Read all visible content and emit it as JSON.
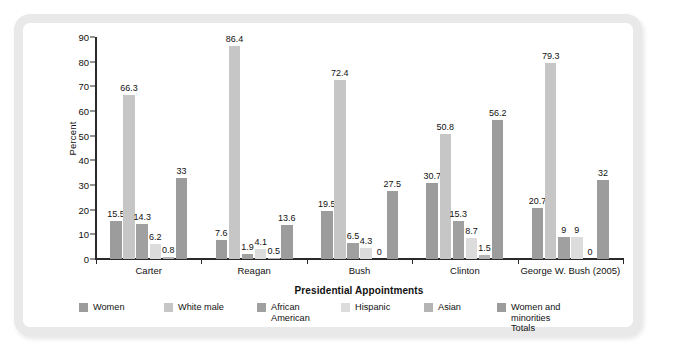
{
  "chart_data": {
    "type": "bar",
    "title": "",
    "xlabel": "Presidential Appointments",
    "ylabel": "Percent",
    "ylim": [
      0,
      90
    ],
    "ytick_step": 10,
    "yticks": [
      0,
      10,
      20,
      30,
      40,
      50,
      60,
      70,
      80,
      90
    ],
    "grid": false,
    "legend_position": "bottom",
    "categories": [
      "Carter",
      "Reagan",
      "Bush",
      "Clinton",
      "George W. Bush (2005)"
    ],
    "series": [
      {
        "name": "Women",
        "color": "#9c9c9c",
        "values": [
          15.5,
          7.6,
          19.5,
          30.7,
          20.7
        ],
        "labels": [
          "15.5",
          "7.6",
          "19.5",
          "30.7",
          "20.7"
        ]
      },
      {
        "name": "White male",
        "color": "#c6c6c6",
        "values": [
          66.3,
          86.4,
          72.4,
          50.8,
          79.3
        ],
        "labels": [
          "66.3",
          "86.4",
          "72.4",
          "50.8",
          "79.3"
        ]
      },
      {
        "name": "African\nAmerican",
        "color": "#a0a0a0",
        "values": [
          14.3,
          1.9,
          6.5,
          15.3,
          9
        ],
        "labels": [
          "14.3",
          "1.9",
          "6.5",
          "15.3",
          "9"
        ]
      },
      {
        "name": "Hispanic",
        "color": "#dcdcdc",
        "values": [
          6.2,
          4.1,
          4.3,
          8.7,
          9
        ],
        "labels": [
          "6.2",
          "4.1",
          "4.3",
          "8.7",
          "9"
        ]
      },
      {
        "name": "Asian",
        "color": "#b4b4b4",
        "values": [
          0.8,
          0.5,
          0,
          1.5,
          0
        ],
        "labels": [
          "0.8",
          "0.5",
          "0",
          "1.5",
          "0"
        ]
      },
      {
        "name": "Women and minorities\nTotals",
        "color": "#9c9c9c",
        "values": [
          33,
          13.6,
          27.5,
          56.2,
          32
        ],
        "labels": [
          "33",
          "13.6",
          "27.5",
          "56.2",
          "32"
        ]
      }
    ]
  },
  "legend": {
    "items": [
      {
        "label": "Women",
        "color": "#9c9c9c"
      },
      {
        "label": "White male",
        "color": "#c6c6c6"
      },
      {
        "label": "African\nAmerican",
        "color": "#a0a0a0"
      },
      {
        "label": "Hispanic",
        "color": "#dcdcdc"
      },
      {
        "label": "Asian",
        "color": "#b4b4b4"
      },
      {
        "label": "Women and minorities\nTotals",
        "color": "#9c9c9c"
      }
    ]
  },
  "frame": {
    "border_color": "#e9e9e9",
    "background": "#ffffff"
  }
}
